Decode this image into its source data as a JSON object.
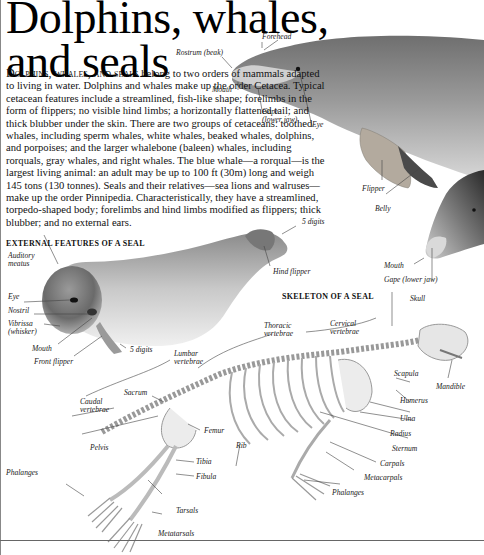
{
  "page": {
    "title_line1": "Dolphins, whales,",
    "title_line2": "and seals",
    "intro_lead": "Dolphins, whales, and seals",
    "intro_body": " belong to two orders of mammals adapted to living in water. Dolphins and whales make up the order Cetacea. Typical cetacean features include a streamlined, fish-like shape; forelimbs in the form of flippers; no visible hind limbs; a horizontally flattened tail; and thick blubber under the skin. There are two groups of cetaceans: toothed whales, including sperm whales, white whales, beaked whales, dolphins, and porpoises; and the larger whalebone (baleen) whales, including rorquals, gray whales, and right whales. The blue whale—a rorqual—is the largest living animal: an adult may be up to 100 ft (30m) long and weigh 145 tons (130 tonnes). Seals and their relatives—sea lions and walruses—make up the order Pinnipedia. Characteristically, they have a streamlined, torpedo-shaped body; forelimbs and hind limbs modified as flippers; thick blubber; and no external ears."
  },
  "dolphin": {
    "labels": {
      "forehead": "Forehead",
      "rostrum": "Rostrum (beak)",
      "mouth": "Mouth",
      "gape": "Gape\n(lower jaw)",
      "eye": "Eye",
      "flipper": "Flipper",
      "belly": "Belly",
      "mouth2": "Mouth",
      "gape2": "Gape (lower jaw)"
    }
  },
  "seal_external": {
    "heading": "EXTERNAL FEATURES OF A SEAL",
    "labels": {
      "auditory": "Auditory\nmeatus",
      "eye": "Eye",
      "nostril": "Nostril",
      "vibrissa": "Vibrissa\n(whisker)",
      "mouth": "Mouth",
      "front_flipper": "Front flipper",
      "digits_front": "5 digits",
      "digits_hind": "5 digits",
      "hind_flipper": "Hind flipper"
    }
  },
  "seal_skeleton": {
    "heading": "SKELETON OF A SEAL",
    "labels": {
      "skull": "Skull",
      "cervical": "Cervical\nvertebrae",
      "thoracic": "Thoracic\nvertebrae",
      "lumbar": "Lumbar\nvertebrae",
      "sacrum": "Sacrum",
      "caudal": "Caudal\nvertebrae",
      "pelvis": "Pelvis",
      "femur": "Femur",
      "rib": "Rib",
      "tibia": "Tibia",
      "fibula": "Fibula",
      "tarsals": "Tarsals",
      "metatarsals": "Metatarsals",
      "phalanges_hind": "Phalanges",
      "scapula": "Scapula",
      "mandible": "Mandible",
      "humerus": "Humerus",
      "ulna": "Ulna",
      "radius": "Radius",
      "sternum": "Sternum",
      "carpals": "Carpals",
      "metacarpals": "Metacarpals",
      "phalanges_fore": "Phalanges"
    }
  }
}
